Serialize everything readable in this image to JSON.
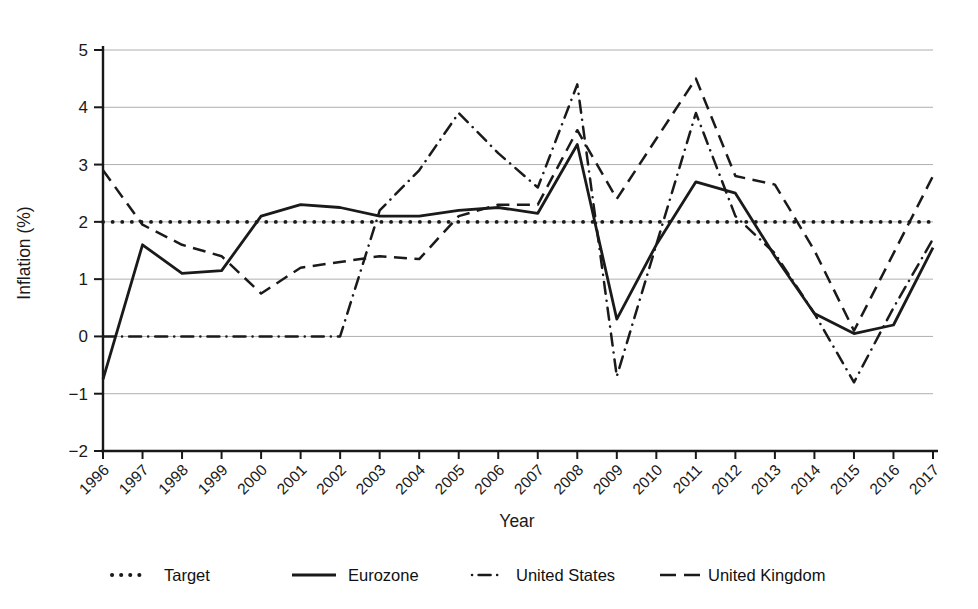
{
  "figure": {
    "background": "#ffffff",
    "line_color": "#1a1a1a",
    "grid_color": "#9a9a9a"
  },
  "chart_data": {
    "type": "line",
    "title": "",
    "xlabel": "Year",
    "ylabel": "Inflation (%)",
    "x": [
      1996,
      1997,
      1998,
      1999,
      2000,
      2001,
      2002,
      2003,
      2004,
      2005,
      2006,
      2007,
      2008,
      2009,
      2010,
      2011,
      2012,
      2013,
      2014,
      2015,
      2016,
      2017
    ],
    "ylim": [
      -2,
      5
    ],
    "yticks": [
      5,
      4,
      3,
      2,
      1,
      0,
      -1,
      -2
    ],
    "grid": "horizontal",
    "xtick_rotation": 45,
    "legend_position": "bottom",
    "series": [
      {
        "name": "Target",
        "style": "dotted",
        "values": [
          2,
          2,
          2,
          2,
          2,
          2,
          2,
          2,
          2,
          2,
          2,
          2,
          2,
          2,
          2,
          2,
          2,
          2,
          2,
          2,
          2,
          2
        ]
      },
      {
        "name": "Eurozone",
        "style": "solid",
        "values": [
          -0.75,
          1.6,
          1.1,
          1.15,
          2.1,
          2.3,
          2.25,
          2.1,
          2.1,
          2.2,
          2.25,
          2.15,
          3.35,
          0.3,
          1.6,
          2.7,
          2.5,
          1.4,
          0.4,
          0.05,
          0.2,
          1.55
        ]
      },
      {
        "name": "United States",
        "style": "dashdot",
        "values": [
          0,
          0,
          0,
          0,
          0,
          0,
          0,
          2.2,
          2.9,
          3.9,
          3.2,
          2.6,
          4.4,
          -0.7,
          1.6,
          3.9,
          2.1,
          1.45,
          0.4,
          -0.8,
          0.5,
          1.7
        ]
      },
      {
        "name": "United Kingdom",
        "style": "dashed",
        "values": [
          2.9,
          1.95,
          1.6,
          1.4,
          0.75,
          1.2,
          1.3,
          1.4,
          1.35,
          2.1,
          2.3,
          2.3,
          3.6,
          2.4,
          3.45,
          4.5,
          2.8,
          2.65,
          1.5,
          0.1,
          1.45,
          2.8
        ]
      }
    ]
  }
}
